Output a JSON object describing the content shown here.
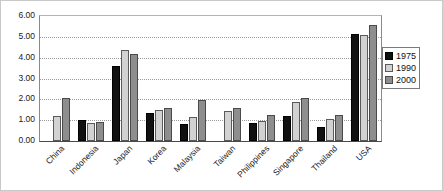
{
  "chart_data": {
    "type": "bar",
    "title": "",
    "subtitle": "",
    "xlabel": "",
    "ylabel": "",
    "ylim": [
      0.0,
      6.0
    ],
    "ytick_step": 1.0,
    "ytick_labels": [
      "6.00",
      "5.00",
      "4.00",
      "3.00",
      "2.00",
      "1.00",
      "0.00"
    ],
    "ytick_values": [
      6.0,
      5.0,
      4.0,
      3.0,
      2.0,
      1.0,
      0.0
    ],
    "grid": true,
    "grid_axis": "y",
    "grid_style": "dotted",
    "legend_position": "right",
    "xtick_rotation": -45,
    "categories": [
      "China",
      "Indonesia",
      "Japan",
      "Korea",
      "Malaysia",
      "Taiwan",
      "Philippines",
      "Singapore",
      "Thailand",
      "USA"
    ],
    "series": [
      {
        "name": "1975",
        "color": "#111111",
        "values": [
          null,
          1.02,
          3.62,
          1.35,
          0.82,
          null,
          0.85,
          1.18,
          0.65,
          5.15
        ]
      },
      {
        "name": "1990",
        "color": "#d2d2d2",
        "values": [
          1.2,
          0.85,
          4.37,
          1.5,
          1.15,
          1.45,
          0.95,
          1.85,
          1.08,
          5.1
        ]
      },
      {
        "name": "2000",
        "color": "#8e8e8e",
        "values": [
          2.05,
          0.92,
          4.2,
          1.6,
          1.95,
          1.6,
          1.25,
          2.05,
          1.25,
          5.55
        ]
      }
    ]
  },
  "legend": {
    "items": [
      {
        "label": "1975",
        "swatch": "s0"
      },
      {
        "label": "1990",
        "swatch": "s1"
      },
      {
        "label": "2000",
        "swatch": "s2"
      }
    ]
  }
}
